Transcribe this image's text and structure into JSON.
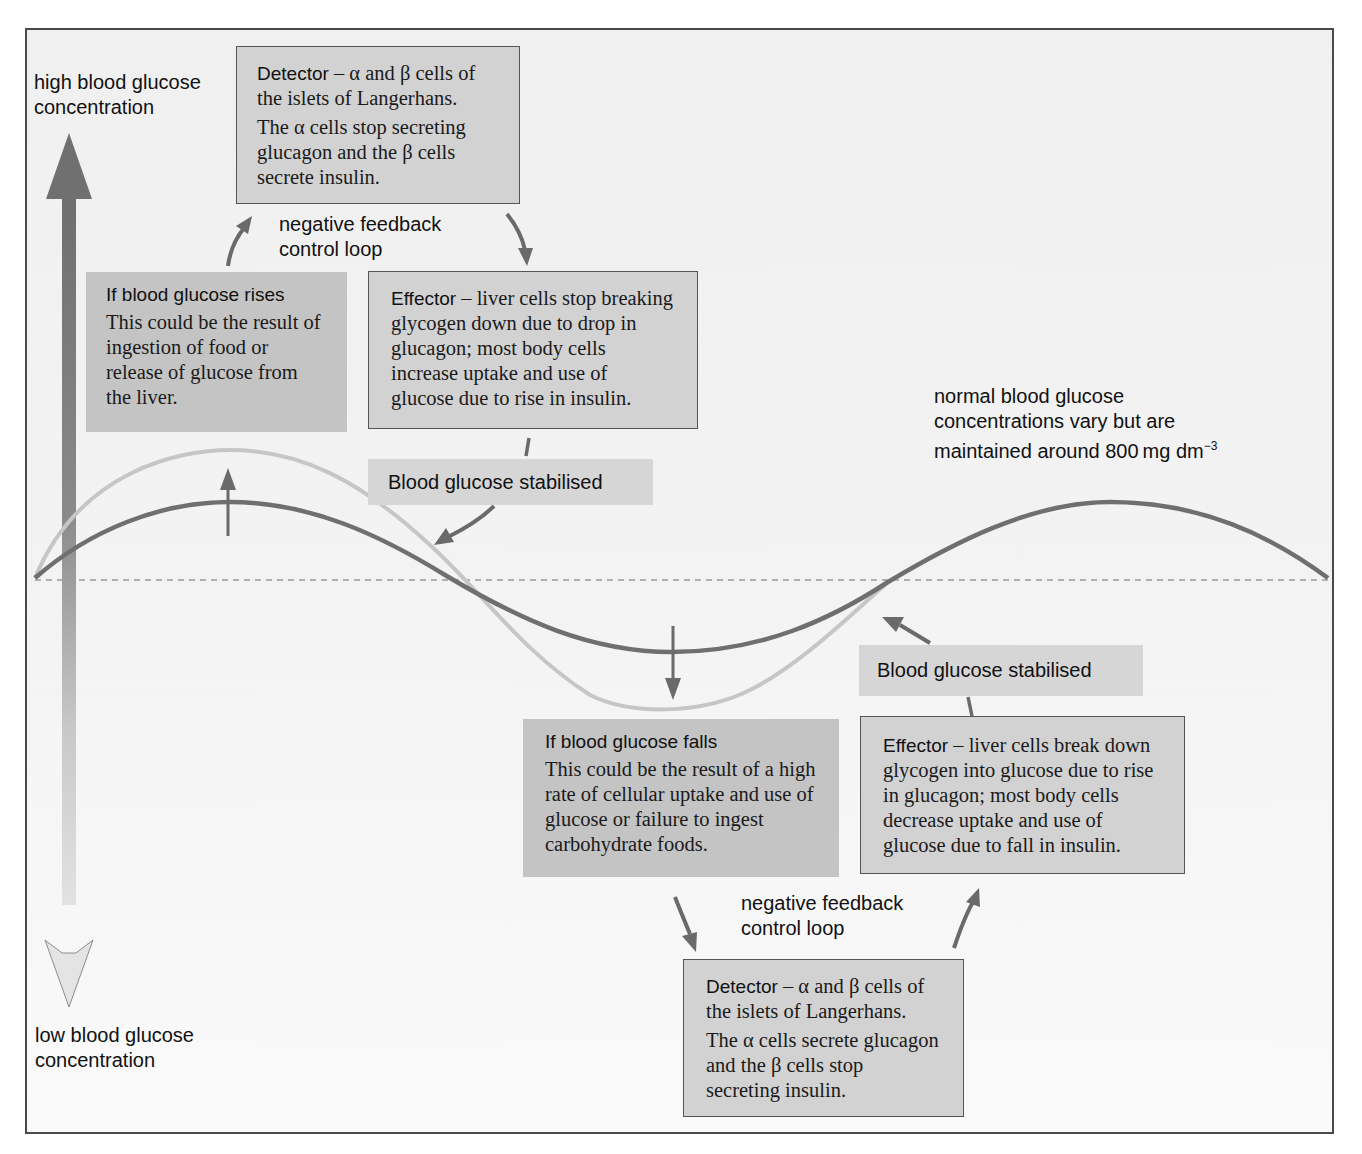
{
  "axis": {
    "high_label_line1": "high blood glucose",
    "high_label_line2": "concentration",
    "low_label_line1": "low blood glucose",
    "low_label_line2": "concentration"
  },
  "normal_note": {
    "line1": "normal blood glucose",
    "line2": "concentrations vary but are",
    "line3": "maintained around 800 mg dm",
    "line3_sup": "−3"
  },
  "rise_loop": {
    "detector": {
      "title": "Detector",
      "title_rest": " – α and β cells of the islets of Langerhans.",
      "detail": "The α cells stop secreting glucagon and the β cells secrete insulin."
    },
    "loop_label_line1": "negative feedback",
    "loop_label_line2": "control loop",
    "trigger": {
      "title": "If blood glucose rises",
      "detail": "This could be the result of ingestion of food or release of glucose from the liver."
    },
    "effector": {
      "title": "Effector",
      "title_rest": " – liver cells stop breaking glycogen down due to drop in glucagon; most body cells increase uptake and use of glucose due to rise in insulin."
    },
    "stabilised": "Blood glucose stabilised"
  },
  "fall_loop": {
    "trigger": {
      "title": "If blood glucose falls",
      "detail": "This could be the result of a high rate of cellular uptake and use of glucose or failure to ingest carbohydrate foods."
    },
    "effector": {
      "title": "Effector",
      "title_rest": "  – liver cells break down glycogen into glucose due to rise in glucagon; most body cells decrease uptake and use of glucose due to fall in insulin."
    },
    "stabilised": "Blood glucose stabilised",
    "loop_label_line1": "negative feedback",
    "loop_label_line2": "control loop",
    "detector": {
      "title": "Detector",
      "title_rest": "  – α and β cells of the islets of Langerhans.",
      "detail": "The α cells secrete glucagon and the β cells stop secreting insulin."
    }
  },
  "colors": {
    "curve_controlled": "#6f6f6f",
    "curve_uncontrolled": "#c4c4c4",
    "arrow": "#6a6a6a",
    "baseline": "#9a9a9a"
  }
}
